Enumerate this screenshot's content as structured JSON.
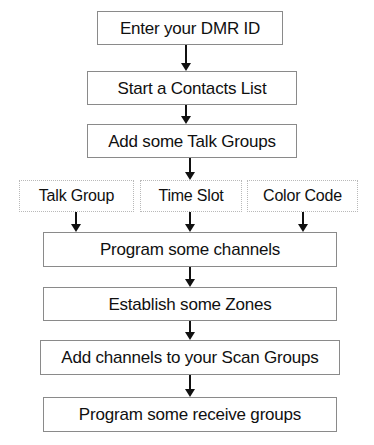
{
  "diagram": {
    "background_color": "#ffffff",
    "text_color": "#101010",
    "solid_border_color": "#8a8a8a",
    "dotted_border_color": "#b9b9b9",
    "arrow_color": "#111111",
    "nodes": [
      {
        "id": "enter-dmr-id",
        "label": "Enter your DMR ID",
        "style": "solid",
        "x": 97,
        "y": 11,
        "w": 186,
        "h": 34,
        "font_size": 17
      },
      {
        "id": "start-contacts-list",
        "label": "Start a Contacts List",
        "style": "solid",
        "x": 87,
        "y": 71,
        "w": 210,
        "h": 34,
        "font_size": 17
      },
      {
        "id": "add-talk-groups",
        "label": "Add some Talk Groups",
        "style": "solid",
        "x": 87,
        "y": 124,
        "w": 210,
        "h": 34,
        "font_size": 17
      },
      {
        "id": "talk-group",
        "label": "Talk Group",
        "style": "dotted",
        "x": 19,
        "y": 180,
        "w": 115,
        "h": 32,
        "font_size": 16
      },
      {
        "id": "time-slot",
        "label": "Time Slot",
        "style": "dotted",
        "x": 140,
        "y": 180,
        "w": 102,
        "h": 32,
        "font_size": 16
      },
      {
        "id": "color-code",
        "label": "Color Code",
        "style": "dotted",
        "x": 247,
        "y": 180,
        "w": 111,
        "h": 32,
        "font_size": 16
      },
      {
        "id": "program-channels",
        "label": "Program some channels",
        "style": "solid",
        "x": 43,
        "y": 232,
        "w": 294,
        "h": 35,
        "font_size": 17
      },
      {
        "id": "establish-zones",
        "label": "Establish some Zones",
        "style": "solid",
        "x": 43,
        "y": 287,
        "w": 294,
        "h": 34,
        "font_size": 17
      },
      {
        "id": "add-channels-scan-groups",
        "label": "Add channels to your Scan Groups",
        "style": "solid",
        "x": 40,
        "y": 340,
        "w": 300,
        "h": 35,
        "font_size": 17
      },
      {
        "id": "program-receive-groups",
        "label": "Program some receive groups",
        "style": "solid",
        "x": 43,
        "y": 397,
        "w": 294,
        "h": 35,
        "font_size": 17
      }
    ],
    "arrows": [
      {
        "id": "arrow-dmrid-to-contacts",
        "x": 186,
        "y": 45,
        "h": 26
      },
      {
        "id": "arrow-contacts-to-talkgroups",
        "x": 186,
        "y": 105,
        "h": 19
      },
      {
        "id": "arrow-talkgroups-to-timeslot",
        "x": 190,
        "y": 158,
        "h": 22
      },
      {
        "id": "arrow-talkgroup-to-channels",
        "x": 76,
        "y": 212,
        "h": 20
      },
      {
        "id": "arrow-timeslot-to-channels",
        "x": 190,
        "y": 212,
        "h": 20
      },
      {
        "id": "arrow-colorcode-to-channels",
        "x": 303,
        "y": 212,
        "h": 20
      },
      {
        "id": "arrow-channels-to-zones",
        "x": 190,
        "y": 267,
        "h": 20
      },
      {
        "id": "arrow-zones-to-scangroups",
        "x": 190,
        "y": 321,
        "h": 19
      },
      {
        "id": "arrow-scangroups-to-receive",
        "x": 190,
        "y": 375,
        "h": 22
      }
    ]
  }
}
